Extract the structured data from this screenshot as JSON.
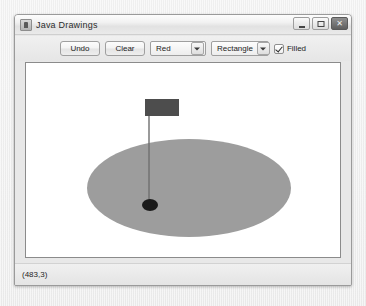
{
  "window": {
    "title": "Java Drawings",
    "icon": "java-app-icon",
    "controls": [
      {
        "name": "minimize",
        "glyph": "–"
      },
      {
        "name": "maximize",
        "glyph": "□"
      },
      {
        "name": "close",
        "glyph": "✕"
      }
    ]
  },
  "toolbar": {
    "undo_label": "Undo",
    "clear_label": "Clear",
    "color_value": "Red",
    "shape_value": "Rectangle",
    "filled_label": "Filled",
    "filled_checked": true
  },
  "canvas": {
    "background": "#ffffff",
    "shapes": [
      {
        "name": "filled-rectangle",
        "type": "rect",
        "x": 119,
        "y": 36,
        "width": 34,
        "height": 17,
        "color": "#4d4d4d"
      },
      {
        "name": "drag-line",
        "type": "line",
        "x1": 123,
        "y1": 53,
        "x2": 123,
        "y2": 139,
        "color": "#6f6f6f",
        "width": 1.4
      },
      {
        "name": "large-ellipse",
        "type": "ellipse",
        "cx": 163,
        "cy": 125,
        "rx": 102,
        "ry": 49,
        "color": "#9d9d9d"
      },
      {
        "name": "small-dot-ellipse",
        "type": "ellipse",
        "cx": 124,
        "cy": 142,
        "rx": 8,
        "ry": 6,
        "color": "#1a1a1a"
      }
    ]
  },
  "statusbar": {
    "coordinates": "(483,3)"
  }
}
